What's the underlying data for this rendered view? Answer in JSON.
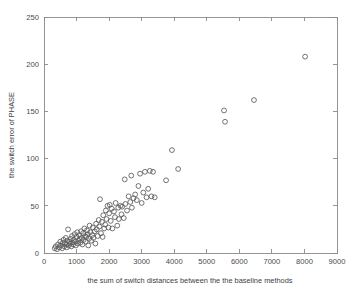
{
  "figure": {
    "background_color": "#ffffff",
    "axis_color": "#8a8a8a",
    "marker_color": "#5a5a5a",
    "text_color": "#3d3d3d"
  },
  "chart_data": {
    "type": "scatter",
    "title": "",
    "xlabel": "the sum of switch distances between the the baseline methods",
    "ylabel": "the switch error of PHASE",
    "xlim": [
      0,
      9000
    ],
    "ylim": [
      0,
      250
    ],
    "xticks": [
      0,
      1000,
      2000,
      3000,
      4000,
      5000,
      6000,
      7000,
      8000,
      9000
    ],
    "yticks": [
      0,
      50,
      100,
      150,
      200,
      250
    ],
    "xtick_labels": [
      "0",
      "1000",
      "2000",
      "3000",
      "4000",
      "5000",
      "6000",
      "7000",
      "8000",
      "9000"
    ],
    "ytick_labels": [
      "0",
      "50",
      "100",
      "150",
      "200",
      "250"
    ],
    "grid": false,
    "legend": null,
    "marker": "open-circle",
    "marker_size": 5,
    "series": [
      {
        "name": "switch error vs sum of switch distances",
        "points": [
          [
            330,
            5
          ],
          [
            360,
            7
          ],
          [
            400,
            4
          ],
          [
            430,
            9
          ],
          [
            470,
            6
          ],
          [
            500,
            12
          ],
          [
            520,
            8
          ],
          [
            560,
            5
          ],
          [
            580,
            11
          ],
          [
            600,
            14
          ],
          [
            620,
            7
          ],
          [
            650,
            10
          ],
          [
            670,
            16
          ],
          [
            690,
            9
          ],
          [
            700,
            6
          ],
          [
            720,
            13
          ],
          [
            740,
            25
          ],
          [
            760,
            8
          ],
          [
            780,
            12
          ],
          [
            800,
            10
          ],
          [
            820,
            15
          ],
          [
            840,
            7
          ],
          [
            860,
            18
          ],
          [
            880,
            11
          ],
          [
            900,
            9
          ],
          [
            920,
            14
          ],
          [
            940,
            20
          ],
          [
            960,
            12
          ],
          [
            980,
            8
          ],
          [
            1000,
            17
          ],
          [
            1020,
            22
          ],
          [
            1040,
            10
          ],
          [
            1060,
            13
          ],
          [
            1080,
            19
          ],
          [
            1100,
            15
          ],
          [
            1120,
            11
          ],
          [
            1140,
            23
          ],
          [
            1160,
            16
          ],
          [
            1180,
            9
          ],
          [
            1200,
            21
          ],
          [
            1220,
            14
          ],
          [
            1240,
            26
          ],
          [
            1260,
            18
          ],
          [
            1280,
            12
          ],
          [
            1300,
            17
          ],
          [
            1320,
            24
          ],
          [
            1340,
            20
          ],
          [
            1360,
            8
          ],
          [
            1380,
            15
          ],
          [
            1400,
            29
          ],
          [
            1420,
            22
          ],
          [
            1450,
            13
          ],
          [
            1480,
            19
          ],
          [
            1500,
            27
          ],
          [
            1520,
            16
          ],
          [
            1560,
            23
          ],
          [
            1580,
            10
          ],
          [
            1600,
            31
          ],
          [
            1620,
            25
          ],
          [
            1650,
            18
          ],
          [
            1680,
            35
          ],
          [
            1700,
            28
          ],
          [
            1720,
            57
          ],
          [
            1750,
            21
          ],
          [
            1780,
            33
          ],
          [
            1800,
            17
          ],
          [
            1820,
            40
          ],
          [
            1850,
            26
          ],
          [
            1880,
            30
          ],
          [
            1900,
            45
          ],
          [
            1920,
            36
          ],
          [
            1950,
            50
          ],
          [
            1980,
            27
          ],
          [
            2000,
            42
          ],
          [
            2020,
            51
          ],
          [
            2050,
            34
          ],
          [
            2080,
            47
          ],
          [
            2100,
            26
          ],
          [
            2150,
            44
          ],
          [
            2180,
            38
          ],
          [
            2200,
            53
          ],
          [
            2250,
            29
          ],
          [
            2280,
            48
          ],
          [
            2300,
            36
          ],
          [
            2350,
            50
          ],
          [
            2380,
            41
          ],
          [
            2400,
            49
          ],
          [
            2450,
            37
          ],
          [
            2480,
            78
          ],
          [
            2500,
            52
          ],
          [
            2550,
            45
          ],
          [
            2600,
            60
          ],
          [
            2650,
            54
          ],
          [
            2680,
            82
          ],
          [
            2700,
            48
          ],
          [
            2750,
            58
          ],
          [
            2800,
            62
          ],
          [
            2850,
            56
          ],
          [
            2900,
            71
          ],
          [
            2950,
            84
          ],
          [
            3000,
            53
          ],
          [
            3050,
            64
          ],
          [
            3100,
            86
          ],
          [
            3150,
            59
          ],
          [
            3200,
            68
          ],
          [
            3250,
            87
          ],
          [
            3300,
            60
          ],
          [
            3350,
            86
          ],
          [
            3400,
            59
          ],
          [
            3750,
            77
          ],
          [
            3930,
            109
          ],
          [
            4120,
            89
          ],
          [
            5530,
            151
          ],
          [
            5560,
            139
          ],
          [
            6450,
            162
          ],
          [
            8020,
            208
          ]
        ]
      }
    ]
  }
}
